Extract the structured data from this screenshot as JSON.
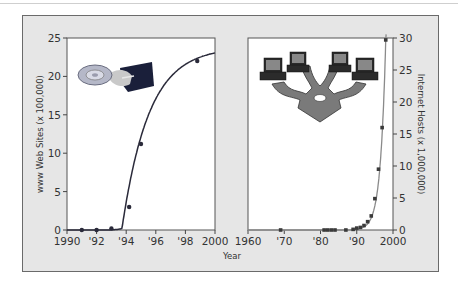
{
  "chart_data": [
    {
      "type": "line",
      "title": "",
      "xlabel": "Year",
      "ylabel": "www Web Sites (x 100,000)",
      "xlim": [
        1990,
        2000
      ],
      "ylim": [
        0,
        25
      ],
      "x_tick_labels": [
        "1990",
        "'92",
        "'94",
        "'96",
        "'98",
        "2000"
      ],
      "y_tick_labels": [
        "0",
        "5",
        "10",
        "15",
        "20",
        "25"
      ],
      "grid": false,
      "legend": null,
      "series": [
        {
          "name": "www Web Sites",
          "x": [
            1991,
            1992,
            1993,
            1994.2,
            1995,
            1998.8
          ],
          "y": [
            0,
            0,
            0.2,
            3,
            11.2,
            22
          ]
        }
      ],
      "annotations": [
        "hand-holding-cd illustration"
      ]
    },
    {
      "type": "line",
      "title": "",
      "xlabel": "Year",
      "ylabel": "Internet Hosts (x 1,000,000)",
      "xlim": [
        1960,
        2000
      ],
      "ylim": [
        0,
        30
      ],
      "x_tick_labels": [
        "1960",
        "'70",
        "'80",
        "'90",
        "2000"
      ],
      "y_tick_labels": [
        "0",
        "5",
        "10",
        "15",
        "20",
        "25",
        "30"
      ],
      "y_axis_position": "right",
      "grid": false,
      "legend": null,
      "series": [
        {
          "name": "Internet Hosts",
          "x": [
            1969,
            1981,
            1982,
            1983,
            1984,
            1987,
            1989,
            1990,
            1991,
            1992,
            1993,
            1994,
            1995,
            1996,
            1997,
            1998
          ],
          "y": [
            0,
            0,
            0,
            0,
            0,
            0,
            0.1,
            0.3,
            0.4,
            0.7,
            1.3,
            2.2,
            4.9,
            9.5,
            16,
            29.7
          ]
        }
      ],
      "annotations": [
        "networked-computers illustration"
      ]
    }
  ],
  "shared_xlabel": "Year"
}
